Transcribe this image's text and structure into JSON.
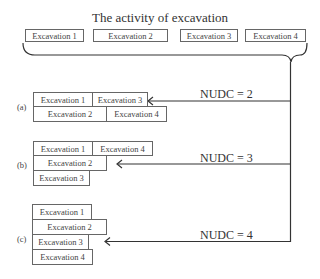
{
  "title": "The activity of excavation",
  "top_row": [
    {
      "label": "Excavation 1"
    },
    {
      "label": "Excavation 2"
    },
    {
      "label": "Excavation 3"
    },
    {
      "label": "Excavation 4"
    }
  ],
  "scenarios": [
    {
      "tag": "(a)",
      "nudc": "NUDC = 2",
      "boxes": [
        "Excavation 1",
        "Excavation 3",
        "Excavation 2",
        "Excavation 4"
      ]
    },
    {
      "tag": "(b)",
      "nudc": "NUDC = 3",
      "boxes": [
        "Excavation 1",
        "Excavation 4",
        "Excavation 2",
        "Excavation 3"
      ]
    },
    {
      "tag": "(c)",
      "nudc": "NUDC = 4",
      "boxes": [
        "Excavation 1",
        "Excavation 2",
        "Excavation 3",
        "Excavation 4"
      ]
    }
  ]
}
